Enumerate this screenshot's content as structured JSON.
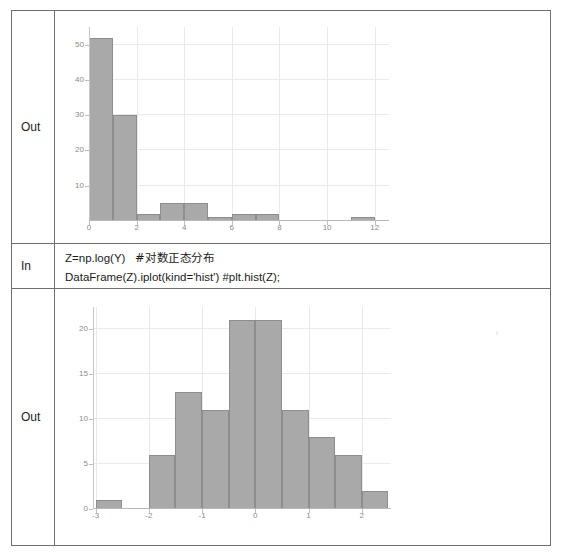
{
  "notebook": {
    "rows": [
      {
        "label": "Out",
        "type": "plot",
        "plot": "hist_y"
      },
      {
        "label": "In",
        "type": "code"
      },
      {
        "label": "Out",
        "type": "plot",
        "plot": "hist_z"
      }
    ],
    "labels": {
      "out1": "Out",
      "in": "In",
      "out2": "Out"
    },
    "code": {
      "line1_code": "Z=np.log(Y)",
      "line1_comment": "#对数正态分布",
      "line2": "DataFrame(Z).iplot(kind='hist') #plt.hist(Z);"
    }
  },
  "chart_data": [
    {
      "id": "hist_y",
      "type": "bar",
      "title": "",
      "xlabel": "",
      "ylabel": "",
      "grid": true,
      "legend": false,
      "xlim": [
        0,
        12.6
      ],
      "ylim": [
        0,
        55
      ],
      "xticks": [
        0,
        2,
        4,
        6,
        8,
        10,
        12
      ],
      "xtick_labels": [
        "0",
        "2",
        "4",
        "6",
        "8",
        "10",
        "12"
      ],
      "yticks": [
        10,
        20,
        30,
        40,
        50
      ],
      "ytick_labels": [
        "10",
        "20",
        "30",
        "40",
        "50"
      ],
      "bin_edges": [
        0,
        1,
        2,
        3,
        4,
        5,
        6,
        7,
        8,
        9,
        10,
        11,
        12
      ],
      "values": [
        52,
        30,
        2,
        5,
        5,
        1,
        2,
        2,
        0,
        0,
        0,
        1
      ],
      "bar_color": "#a9a9a9",
      "bar_edge_color": "#8d8d8d"
    },
    {
      "id": "hist_z",
      "type": "bar",
      "title": "",
      "xlabel": "",
      "ylabel": "",
      "grid": true,
      "legend": false,
      "xlim": [
        -3.05,
        2.55
      ],
      "ylim": [
        0,
        22.5
      ],
      "xticks": [
        -3,
        -2,
        -1,
        0,
        1,
        2
      ],
      "xtick_labels": [
        "-3",
        "-2",
        "-1",
        "0",
        "1",
        "2"
      ],
      "yticks": [
        0,
        5,
        10,
        15,
        20
      ],
      "ytick_labels": [
        "0",
        "5",
        "10",
        "15",
        "20"
      ],
      "bin_edges": [
        -3.0,
        -2.5,
        -2.0,
        -1.5,
        -1.0,
        -0.5,
        0.0,
        0.5,
        1.0,
        1.5,
        2.0,
        2.5
      ],
      "values": [
        1,
        0,
        6,
        13,
        11,
        21,
        21,
        11,
        8,
        6,
        2
      ],
      "bar_color": "#a9a9a9",
      "bar_edge_color": "#8d8d8d"
    }
  ]
}
